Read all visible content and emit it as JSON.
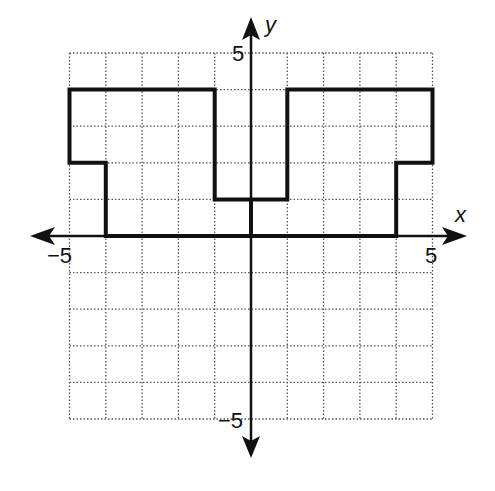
{
  "chart_data": {
    "type": "diagram",
    "title": "",
    "xlabel": "x",
    "ylabel": "y",
    "xlim": [
      -5,
      5
    ],
    "ylim": [
      -5,
      5
    ],
    "grid": true,
    "grid_style": "dotted",
    "tick_labels": {
      "x": [
        {
          "value": -5,
          "label": "−5"
        },
        {
          "value": 5,
          "label": "5"
        }
      ],
      "y": [
        {
          "value": 5,
          "label": "5"
        },
        {
          "value": -5,
          "label": "−5"
        }
      ]
    },
    "polygon": {
      "name": "shape",
      "stroke": "#111111",
      "vertices": [
        [
          -5,
          4
        ],
        [
          -1,
          4
        ],
        [
          -1,
          1
        ],
        [
          1,
          1
        ],
        [
          1,
          4
        ],
        [
          5,
          4
        ],
        [
          5,
          2
        ],
        [
          4,
          2
        ],
        [
          4,
          0
        ],
        [
          -4,
          0
        ],
        [
          -4,
          2
        ],
        [
          -5,
          2
        ]
      ]
    }
  },
  "labels": {
    "x_axis": "x",
    "y_axis": "y",
    "x_min": "−5",
    "x_max": "5",
    "y_max": "5",
    "y_min": "−5"
  },
  "colors": {
    "ink": "#111111",
    "grid": "#555555",
    "background": "#ffffff"
  }
}
